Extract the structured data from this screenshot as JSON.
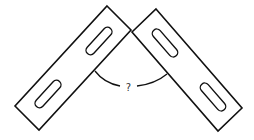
{
  "diagram": {
    "title": "",
    "angle_label": "?",
    "elements": [
      {
        "name": "left-bracket-bar",
        "slots": 2
      },
      {
        "name": "right-bracket-bar",
        "slots": 2
      },
      {
        "name": "angle-arc",
        "label": "?"
      }
    ],
    "colors": {
      "stroke": "#111111",
      "background": "#ffffff"
    }
  }
}
